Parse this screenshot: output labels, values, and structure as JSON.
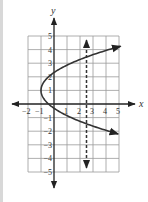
{
  "chart_data": {
    "type": "line",
    "title": "",
    "xlabel": "x",
    "ylabel": "y",
    "xlim": [
      -2,
      5
    ],
    "ylim": [
      -5,
      5
    ],
    "grid": true,
    "x_ticks": [
      -2,
      -1,
      1,
      2,
      3,
      4,
      5
    ],
    "x_tick_labels": [
      "−2",
      "−1",
      "1",
      "2",
      "3",
      "4",
      "5"
    ],
    "y_ticks": [
      5,
      4,
      3,
      2,
      1,
      -1,
      -2,
      -3,
      -4,
      -5
    ],
    "y_tick_labels": [
      "5",
      "4",
      "3",
      "2",
      "1",
      "−1",
      "−2",
      "−3",
      "−4",
      "−5"
    ],
    "series": [
      {
        "name": "parabola",
        "kind": "sideways-parabola",
        "description": "x = a(y - 1)^2 - 1, opens right, arrows at both ends",
        "vertex": [
          -1,
          1
        ],
        "a": 0.58,
        "y_range": [
          -2.2,
          4.25
        ],
        "style": "solid",
        "color": "#333333"
      },
      {
        "name": "vertical-line",
        "kind": "vertical-line",
        "description": "x = 2.5, dashed with arrows at both ends",
        "x": 2.5,
        "y_range": [
          -4.7,
          4.7
        ],
        "style": "dashed",
        "color": "#333333"
      }
    ]
  },
  "colors": {
    "grid": "#9a9a9a",
    "axis": "#222222",
    "curve": "#333333",
    "frame": "#d8d8d8"
  }
}
